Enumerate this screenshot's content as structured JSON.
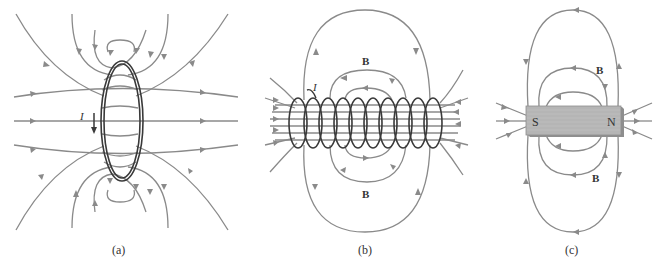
{
  "figure": {
    "panels": [
      {
        "id": "a",
        "caption": "(a)",
        "subject": "single current loop",
        "current_label": "I"
      },
      {
        "id": "b",
        "caption": "(b)",
        "subject": "solenoid",
        "current_label": "I",
        "field_label_top": "B",
        "field_label_bottom": "B"
      },
      {
        "id": "c",
        "caption": "(c)",
        "subject": "bar magnet",
        "pole_left": "S",
        "pole_right": "N",
        "field_label_top": "B",
        "field_label_bottom": "B"
      }
    ]
  },
  "colors": {
    "field_line": "#8a8a8a",
    "wire": "#3a3a3a",
    "magnet": "#b5b5b5",
    "magnet_edge": "#8e8e8e"
  }
}
